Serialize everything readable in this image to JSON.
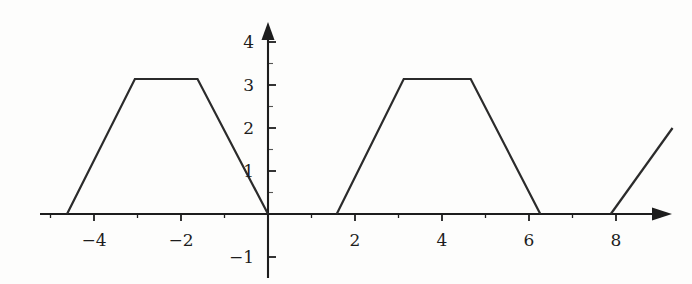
{
  "figure": {
    "title": "",
    "background_color": "#fdfdfc",
    "line_color": "#2b2b2b",
    "axis_color": "#1d1d1d"
  },
  "axes": {
    "origin_px": {
      "x": 268,
      "y": 214
    },
    "x_unit_px": 43.5,
    "y_unit_px": 43.0,
    "x_axis_label": "",
    "y_axis_label": "",
    "x_tick_labels": [
      {
        "value": -4,
        "text": "-4"
      },
      {
        "value": -2,
        "text": "-2"
      },
      {
        "value": 2,
        "text": "2"
      },
      {
        "value": 4,
        "text": "4"
      },
      {
        "value": 6,
        "text": "6"
      },
      {
        "value": 8,
        "text": "8"
      }
    ],
    "y_tick_labels": [
      {
        "value": 4,
        "text": "4"
      },
      {
        "value": 3,
        "text": "3"
      },
      {
        "value": 2,
        "text": "2"
      },
      {
        "value": 1,
        "text": "1"
      },
      {
        "value": -1,
        "text": "-1"
      }
    ],
    "x_minor_ticks": [
      -5,
      -4,
      -3,
      -2,
      -1,
      1,
      2,
      3,
      4,
      5,
      6,
      7,
      8,
      9
    ],
    "y_minor_ticks": [
      -1,
      1,
      2,
      3,
      4
    ],
    "arrow_x_positive": true,
    "arrow_y_positive": true,
    "grid": false
  },
  "chart_data": {
    "type": "line",
    "title": "",
    "xlabel": "",
    "ylabel": "",
    "xlim": [
      -5.6,
      9.8
    ],
    "ylim": [
      -1.6,
      4.7
    ],
    "grid": false,
    "legend": "none",
    "amplitude": 3.14,
    "period": 6.28,
    "series": [
      {
        "name": "trapezoid-left",
        "points": [
          {
            "x": -4.62,
            "y": 0
          },
          {
            "x": -3.06,
            "y": 3.14
          },
          {
            "x": -1.62,
            "y": 3.14
          },
          {
            "x": 0,
            "y": 0
          }
        ]
      },
      {
        "name": "baseline-gap-left",
        "points": [
          {
            "x": 0,
            "y": 0
          },
          {
            "x": 1.58,
            "y": 0
          }
        ]
      },
      {
        "name": "trapezoid-right",
        "points": [
          {
            "x": 1.58,
            "y": 0
          },
          {
            "x": 3.12,
            "y": 3.14
          },
          {
            "x": 4.66,
            "y": 3.14
          },
          {
            "x": 6.26,
            "y": 0
          }
        ]
      },
      {
        "name": "baseline-gap-right",
        "points": [
          {
            "x": 6.26,
            "y": 0
          },
          {
            "x": 7.88,
            "y": 0
          }
        ]
      },
      {
        "name": "partial-rise",
        "points": [
          {
            "x": 7.88,
            "y": 0
          },
          {
            "x": 9.3,
            "y": 2.0
          }
        ]
      }
    ]
  }
}
